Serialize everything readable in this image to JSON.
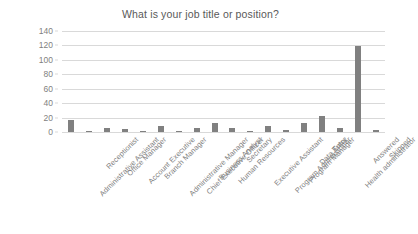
{
  "chart_data": {
    "type": "bar",
    "title": "What is your job title or position?",
    "xlabel": "",
    "ylabel": "",
    "ylim": [
      0,
      140
    ],
    "yticks": [
      0,
      20,
      40,
      60,
      80,
      100,
      120,
      140
    ],
    "grid": true,
    "legend": false,
    "bar_color": "#808080",
    "gridline_color": "#d9d9d9",
    "text_color": "#7f7f7f",
    "title_color": "#595959",
    "categories": [
      "Administrative Assistant",
      "Receptionist",
      "Office Manager",
      "Account Executive",
      "Branch Manager",
      "Administrative Manager",
      "Chief Executive Officer",
      "Business Analyst",
      "Human Resources",
      "Secretary",
      "Executive Assistant",
      "Program Administrator",
      "Program Manager",
      "Data Entry",
      "Tutor",
      "Health administrator",
      "Answered",
      "Skipped"
    ],
    "values": [
      17,
      1,
      6,
      4,
      2,
      8,
      1,
      5,
      12,
      6,
      1,
      8,
      3,
      13,
      22,
      5,
      119,
      3
    ]
  }
}
